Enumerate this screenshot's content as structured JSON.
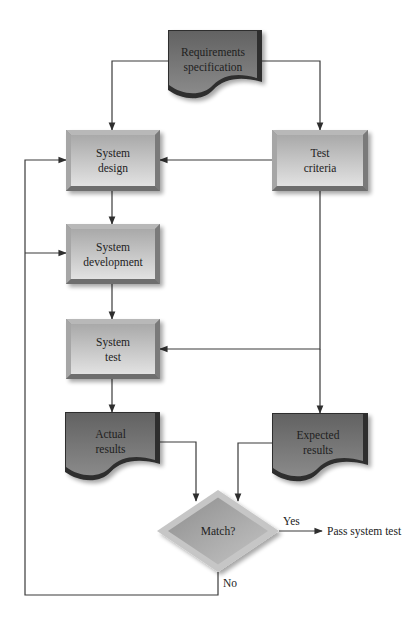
{
  "diagram": {
    "type": "flowchart",
    "colors": {
      "process_light": "#d6d6d6",
      "process_dark": "#a8a8a8",
      "process_bevel": "#8a8a8a",
      "document_fill": "#6e6e6e",
      "document_edge": "#2e2e2e",
      "decision_fill": "#9c9c9c",
      "decision_rim": "#c8c8c8",
      "line": "#3a3a3a"
    },
    "nodes": [
      {
        "id": "requirements",
        "shape": "document",
        "lines": [
          "Requirements",
          "specification"
        ],
        "x": 168,
        "y": 30,
        "w": 94,
        "h": 66
      },
      {
        "id": "system-design",
        "shape": "process",
        "lines": [
          "System",
          "design"
        ],
        "x": 66,
        "y": 130,
        "w": 94,
        "h": 61
      },
      {
        "id": "test-criteria",
        "shape": "process",
        "lines": [
          "Test",
          "criteria"
        ],
        "x": 272,
        "y": 130,
        "w": 96,
        "h": 61
      },
      {
        "id": "system-development",
        "shape": "process",
        "lines": [
          "System",
          "development"
        ],
        "x": 66,
        "y": 224,
        "w": 94,
        "h": 60
      },
      {
        "id": "system-test",
        "shape": "process",
        "lines": [
          "System",
          "test"
        ],
        "x": 66,
        "y": 319,
        "w": 94,
        "h": 60
      },
      {
        "id": "actual-results",
        "shape": "document",
        "lines": [
          "Actual",
          "results"
        ],
        "x": 65,
        "y": 412,
        "w": 95,
        "h": 66
      },
      {
        "id": "expected-results",
        "shape": "document",
        "lines": [
          "Expected",
          "results"
        ],
        "x": 272,
        "y": 413,
        "w": 96,
        "h": 66
      },
      {
        "id": "match",
        "shape": "decision",
        "lines": [
          "Match?"
        ],
        "cx": 218,
        "cy": 531,
        "rx": 61,
        "ry": 41
      }
    ],
    "edges": [
      {
        "id": "req-to-design",
        "points": [
          [
            168,
            61
          ],
          [
            112,
            61
          ],
          [
            112,
            130
          ]
        ],
        "arrow": true
      },
      {
        "id": "req-to-criteria",
        "points": [
          [
            262,
            61
          ],
          [
            320,
            61
          ],
          [
            320,
            130
          ]
        ],
        "arrow": true
      },
      {
        "id": "criteria-to-design",
        "points": [
          [
            272,
            160
          ],
          [
            160,
            160
          ]
        ],
        "arrow": true
      },
      {
        "id": "design-to-development",
        "points": [
          [
            112,
            191
          ],
          [
            112,
            224
          ]
        ],
        "arrow": true
      },
      {
        "id": "development-to-test",
        "points": [
          [
            112,
            284
          ],
          [
            112,
            319
          ]
        ],
        "arrow": true
      },
      {
        "id": "criteria-to-test",
        "points": [
          [
            320,
            191
          ],
          [
            320,
            349
          ],
          [
            160,
            349
          ]
        ],
        "arrow": true
      },
      {
        "id": "criteria-to-expected",
        "points": [
          [
            320,
            349
          ],
          [
            320,
            413
          ]
        ],
        "arrow": true
      },
      {
        "id": "test-to-actual",
        "points": [
          [
            112,
            379
          ],
          [
            112,
            412
          ]
        ],
        "arrow": true
      },
      {
        "id": "actual-to-match",
        "points": [
          [
            160,
            442
          ],
          [
            196,
            442
          ],
          [
            196,
            501
          ]
        ],
        "arrow": true
      },
      {
        "id": "expected-to-match",
        "points": [
          [
            272,
            443
          ],
          [
            238,
            443
          ],
          [
            238,
            501
          ]
        ],
        "arrow": true
      },
      {
        "id": "match-yes",
        "points": [
          [
            279,
            531
          ],
          [
            322,
            531
          ]
        ],
        "arrow": true
      },
      {
        "id": "match-no-loop",
        "points": [
          [
            218,
            572
          ],
          [
            218,
            595
          ],
          [
            25,
            595
          ],
          [
            25,
            160
          ],
          [
            66,
            160
          ]
        ],
        "arrow": true
      },
      {
        "id": "loop-to-development",
        "points": [
          [
            25,
            253
          ],
          [
            66,
            253
          ]
        ],
        "arrow": true
      }
    ],
    "edge_labels": [
      {
        "id": "yes-label",
        "text": "Yes",
        "x": 283,
        "y": 525
      },
      {
        "id": "no-label",
        "text": "No",
        "x": 223,
        "y": 587
      },
      {
        "id": "pass-label",
        "text": "Pass system test",
        "x": 327,
        "y": 535
      }
    ]
  }
}
